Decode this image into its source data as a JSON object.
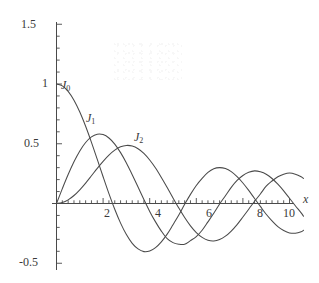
{
  "chart_data": {
    "type": "line",
    "title": "",
    "subtitle": "",
    "xlabel": "x",
    "ylabel": "",
    "xlim": [
      0,
      10.6
    ],
    "ylim": [
      -0.5,
      1.5
    ],
    "grid": false,
    "legend_position": "inline-curve-labels",
    "x_ticks_major": [
      2,
      4,
      6,
      8,
      10
    ],
    "x_tick_labels": [
      "2",
      "4",
      "6",
      "8",
      "10"
    ],
    "x_minor_tick_step": 0.25,
    "y_ticks_major": [
      -0.5,
      0.5,
      1,
      1.5
    ],
    "y_tick_labels": [
      "-0.5",
      "0.5",
      "1",
      "1.5"
    ],
    "y_minor_tick_step": 0.1,
    "series": [
      {
        "name": "J0",
        "label": "J",
        "order": "0",
        "color": "#4a4a4a",
        "x": [
          0,
          0.25,
          0.5,
          0.75,
          1,
          1.25,
          1.5,
          1.75,
          2,
          2.25,
          2.5,
          2.75,
          3,
          3.25,
          3.5,
          3.75,
          4,
          4.25,
          4.5,
          4.75,
          5,
          5.25,
          5.5,
          5.75,
          6,
          6.25,
          6.5,
          6.75,
          7,
          7.25,
          7.5,
          7.75,
          8,
          8.25,
          8.5,
          8.75,
          9,
          9.25,
          9.5,
          9.75,
          10,
          10.25,
          10.5,
          10.6
        ],
        "y": [
          1.0,
          0.9844,
          0.9385,
          0.8642,
          0.7652,
          0.6459,
          0.5118,
          0.369,
          0.2239,
          0.0827,
          -0.0484,
          -0.1641,
          -0.2601,
          -0.3332,
          -0.3801,
          -0.4026,
          -0.3971,
          -0.3686,
          -0.3205,
          -0.2566,
          -0.1776,
          -0.0968,
          -0.0068,
          0.0766,
          0.1506,
          0.2101,
          0.2601,
          0.2913,
          0.3001,
          0.2921,
          0.2663,
          0.2245,
          0.1717,
          0.1096,
          0.0419,
          -0.0245,
          -0.0903,
          -0.1455,
          -0.1939,
          -0.2258,
          -0.2459,
          -0.249,
          -0.2366,
          -0.2243
        ]
      },
      {
        "name": "J1",
        "label": "J",
        "order": "1",
        "color": "#4a4a4a",
        "x": [
          0,
          0.25,
          0.5,
          0.75,
          1,
          1.25,
          1.5,
          1.75,
          2,
          2.25,
          2.5,
          2.75,
          3,
          3.25,
          3.5,
          3.75,
          4,
          4.25,
          4.5,
          4.75,
          5,
          5.25,
          5.5,
          5.75,
          6,
          6.25,
          6.5,
          6.75,
          7,
          7.25,
          7.5,
          7.75,
          8,
          8.25,
          8.5,
          8.75,
          9,
          9.25,
          9.5,
          9.75,
          10,
          10.25,
          10.5,
          10.6
        ],
        "y": [
          0.0,
          0.124,
          0.2423,
          0.3492,
          0.4401,
          0.5106,
          0.5579,
          0.5802,
          0.5767,
          0.5484,
          0.4971,
          0.4256,
          0.3391,
          0.2404,
          0.1374,
          0.0341,
          -0.066,
          -0.1538,
          -0.2311,
          -0.2943,
          -0.3276,
          -0.3414,
          -0.3414,
          -0.311,
          -0.2767,
          -0.224,
          -0.1538,
          -0.0823,
          -0.0047,
          0.0648,
          0.1352,
          0.1934,
          0.2346,
          0.2609,
          0.2731,
          0.2655,
          0.2453,
          0.2094,
          0.1613,
          0.106,
          0.0435,
          -0.0184,
          -0.0789,
          -0.1063
        ]
      },
      {
        "name": "J2",
        "label": "J",
        "order": "2",
        "color": "#4a4a4a",
        "x": [
          0,
          0.25,
          0.5,
          0.75,
          1,
          1.25,
          1.5,
          1.75,
          2,
          2.25,
          2.5,
          2.75,
          3,
          3.25,
          3.5,
          3.75,
          4,
          4.25,
          4.5,
          4.75,
          5,
          5.25,
          5.5,
          5.75,
          6,
          6.25,
          6.5,
          6.75,
          7,
          7.25,
          7.5,
          7.75,
          8,
          8.25,
          8.5,
          8.75,
          9,
          9.25,
          9.5,
          9.75,
          10,
          10.25,
          10.5,
          10.6
        ],
        "y": [
          0.0,
          0.0078,
          0.0306,
          0.067,
          0.1149,
          0.1711,
          0.2321,
          0.294,
          0.3528,
          0.4048,
          0.4461,
          0.4751,
          0.4861,
          0.4813,
          0.4586,
          0.4194,
          0.3641,
          0.2966,
          0.2178,
          0.134,
          0.0466,
          -0.0381,
          -0.1173,
          -0.1867,
          -0.2429,
          -0.2835,
          -0.3074,
          -0.3132,
          -0.3014,
          -0.2735,
          -0.2303,
          -0.1762,
          -0.113,
          -0.0477,
          0.0184,
          0.0795,
          0.1448,
          0.1882,
          0.2235,
          0.2446,
          0.2546,
          0.2453,
          0.2243,
          0.2097
        ]
      }
    ]
  },
  "labels": {
    "y_1_5": "1.5",
    "y_1": "1",
    "y_0_5": "0.5",
    "y_neg_0_5": "-0.5",
    "x_2": "2",
    "x_4": "4",
    "x_6": "6",
    "x_8": "8",
    "x_10": "10",
    "axis_x": "x",
    "j0_base": "J",
    "j0_sub": "0",
    "j1_base": "J",
    "j1_sub": "1",
    "j2_base": "J",
    "j2_sub": "2"
  },
  "colors": {
    "curve": "#4a4a4a",
    "axis": "#4a4a4a",
    "text": "#3a3a3a",
    "background": "#ffffff"
  }
}
